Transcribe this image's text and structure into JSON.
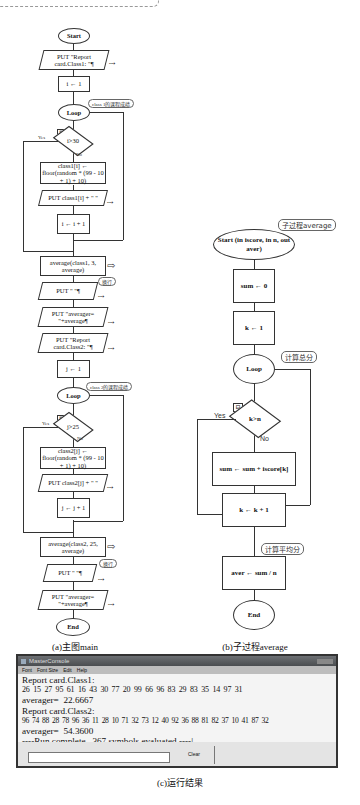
{
  "main_flowchart": {
    "caption": "(a)主图main",
    "nodes": {
      "start": "Start",
      "put_report1": "PUT \"Report card.Class1: \"¶",
      "i_init": "i ← 1",
      "loop1": "Loop",
      "loop1_note": "class 1的课程成绩",
      "cond1": "i>30",
      "cond1_yes": "Yes",
      "cond1_no": "No",
      "assign1": "class1[i] ← floor(random * (99 - 10 + 1) + 10)",
      "put_class1": "PUT class1[i] + \" \"",
      "i_inc": "i ← i + 1",
      "avg1_call": "average(class1, 3, average)",
      "put_newline1": "PUT \" \"¶",
      "newline1_note": "换行",
      "put_avg1": "PUT \"averager= \"+average¶",
      "put_report2": "PUT \"Report card.Class2: \"¶",
      "j_init": "j ← 1",
      "loop2": "Loop",
      "loop2_note": "class 2的课程成绩",
      "cond2": "j>25",
      "cond2_yes": "Yes",
      "cond2_no": "No",
      "assign2": "class2[j] ← floor(random * (99 - 10 + 1) + 10)",
      "put_class2": "PUT class2[j] + \" \"",
      "j_inc": "j ← j + 1",
      "avg2_call": "average(class2, 25, average)",
      "put_newline2": "PUT \" \"¶",
      "newline2_note": "换行",
      "put_avg2": "PUT \"averager= \"+average¶",
      "end": "End"
    }
  },
  "sub_flowchart": {
    "caption": "(b)子过程average",
    "nodes": {
      "title_note": "子过程average",
      "start": "Start (in iscore, in n, out aver)",
      "sum_init": "sum ← 0",
      "k_init": "k ← 1",
      "loop": "Loop",
      "loop_note": "计算总分",
      "cond": "k>n",
      "cond_yes": "Yes",
      "cond_no": "No",
      "sum_add": "sum ← sum + iscore[k]",
      "k_inc": "k ← k + 1",
      "avg_note": "计算平均分",
      "aver_calc": "aver ← sum / n",
      "end": "End"
    }
  },
  "console": {
    "caption": "(c)运行结果",
    "window_title": "MasterConsole",
    "menu": [
      "Font",
      "Font Size",
      "Edit",
      "Help"
    ],
    "output_lines": [
      "Report card.Class1:",
      "26  15  27  95  61  16  43  30  77  20  99  66  96  83  29  83  35  14  97  31",
      "averager=  22.6667",
      "Report card.Class2:",
      "96  74  88  28  78  96  36  11  28  10  71  32  73  12  40  92  36  88  81  82  37  10  41  87  32",
      "averager=  54.3600",
      "----Run complete.  367 symbols evaluated.----|"
    ],
    "input_value": "",
    "clear_button": "Clear"
  }
}
